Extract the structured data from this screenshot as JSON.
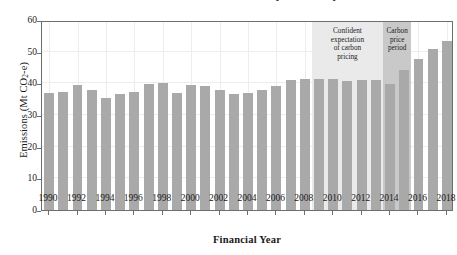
{
  "figure": {
    "clipped_title": "Emissions have risen since the carbon price was repealed",
    "bar_color": "#a9a9a9",
    "band_light_color": "#eaeaea",
    "band_dark_color": "#c9c9c9",
    "axis_color": "#6e6e6e",
    "grid_color": "#ededed",
    "background": "#ffffff"
  },
  "chart_data": {
    "type": "bar",
    "title": "",
    "xlabel": "Financial Year",
    "ylabel": "Emissions (Mt CO2-e)",
    "ylabel_parts": {
      "pre": "Emissions (Mt CO",
      "sub": "2",
      "post": "-e)"
    },
    "ylim": [
      0,
      60
    ],
    "yticks": [
      0,
      10,
      20,
      30,
      40,
      50,
      60
    ],
    "xticks": [
      1990,
      1992,
      1994,
      1996,
      1998,
      2000,
      2002,
      2004,
      2006,
      2008,
      2010,
      2012,
      2014,
      2016,
      2018
    ],
    "grid": true,
    "legend": "none",
    "categories": [
      1990,
      1991,
      1992,
      1993,
      1994,
      1995,
      1996,
      1997,
      1998,
      1999,
      2000,
      2001,
      2002,
      2003,
      2004,
      2005,
      2006,
      2007,
      2008,
      2009,
      2010,
      2011,
      2012,
      2013,
      2014,
      2015,
      2016,
      2017,
      2018
    ],
    "values": [
      37.1,
      37.3,
      39.4,
      37.8,
      35.4,
      36.7,
      37.2,
      39.8,
      40.1,
      36.8,
      39.6,
      39.1,
      37.9,
      36.6,
      36.9,
      38.0,
      39.1,
      41.2,
      41.3,
      41.3,
      41.5,
      40.8,
      41.1,
      41.1,
      39.7,
      44.3,
      47.7,
      50.7,
      53.3
    ],
    "annotations": [
      {
        "id": "confident-expectation",
        "label": "Confident expectation of carbon pricing",
        "lines": [
          "Confident",
          "expectation",
          "of carbon",
          "pricing"
        ],
        "start_year": 2009,
        "end_year": 2013,
        "shade": "#eaeaea"
      },
      {
        "id": "carbon-price-period",
        "label": "Carbon price period",
        "lines": [
          "Carbon",
          "price",
          "period"
        ],
        "start_year": 2014,
        "end_year": 2015,
        "shade": "#c9c9c9"
      }
    ]
  }
}
